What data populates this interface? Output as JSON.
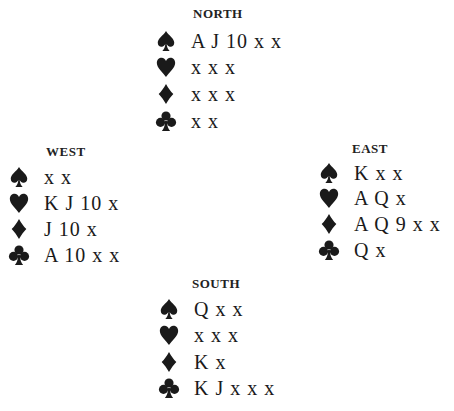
{
  "hands": {
    "north": {
      "label": "NORTH",
      "spades": "A J 10 x x",
      "hearts": "x x x",
      "diamonds": "x x x",
      "clubs": "x x"
    },
    "west": {
      "label": "WEST",
      "spades": "x x",
      "hearts": "K J 10 x",
      "diamonds": "J 10 x",
      "clubs": "A 10 x x"
    },
    "east": {
      "label": "EAST",
      "spades": "K x x",
      "hearts": "A Q x",
      "diamonds": "A Q 9 x x",
      "clubs": "Q x"
    },
    "south": {
      "label": "SOUTH",
      "spades": "Q x x",
      "hearts": "x x x",
      "diamonds": "K x",
      "clubs": "K J x x x"
    }
  },
  "suit_icons": [
    "spade-icon",
    "heart-icon",
    "diamond-icon",
    "club-icon"
  ],
  "colors": {
    "ink": "#1a1a1a",
    "background": "#ffffff"
  }
}
